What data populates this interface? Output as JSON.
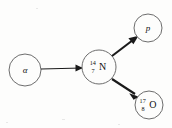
{
  "diagram": {
    "background_color": "#fdfdfc",
    "stroke_color": "#6d6d6d",
    "arrow_color": "#1a1a1a",
    "nodes": [
      {
        "id": "alpha",
        "role": "incoming-projectile",
        "label": "α",
        "label_style": "italic-greek",
        "cx": 25,
        "cy": 70,
        "r": 16
      },
      {
        "id": "nitrogen-14",
        "role": "target-nucleus",
        "mass_number": "14",
        "atomic_number": "7",
        "element_symbol": "N",
        "label": "14 7 N",
        "cx": 99,
        "cy": 67,
        "r": 17
      },
      {
        "id": "proton",
        "role": "ejected-particle",
        "label": "p",
        "label_style": "italic",
        "cx": 148,
        "cy": 28,
        "r": 14
      },
      {
        "id": "oxygen-17",
        "role": "product-nucleus",
        "mass_number": "17",
        "atomic_number": "8",
        "element_symbol": "O",
        "label": "17 8 O",
        "cx": 149,
        "cy": 105,
        "r": 14
      }
    ],
    "arrows": [
      {
        "id": "alpha-to-nitrogen",
        "from": "alpha",
        "to": "nitrogen-14",
        "direction": "right",
        "weight": "thin",
        "x1": 41,
        "y1": 69,
        "x2": 82,
        "y2": 68
      },
      {
        "id": "nitrogen-to-proton",
        "from": "nitrogen-14",
        "to": "proton",
        "direction": "up-right",
        "weight": "thick",
        "x1": 112,
        "y1": 56,
        "x2": 137,
        "y2": 37
      },
      {
        "id": "nitrogen-to-oxygen",
        "from": "nitrogen-14",
        "to": "oxygen-17",
        "direction": "down-right",
        "weight": "thick",
        "x1": 112,
        "y1": 79,
        "x2": 138,
        "y2": 96
      }
    ],
    "reaction": {
      "equation": "α + ¹⁴₇N → p + ¹⁷₈O",
      "reactants": [
        "α",
        "14 7 N"
      ],
      "products": [
        "p",
        "17 8 O"
      ]
    }
  }
}
